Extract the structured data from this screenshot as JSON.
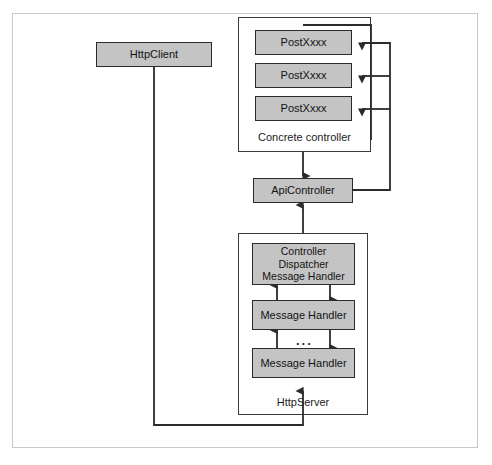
{
  "figure": {
    "background": "#ffffff",
    "frame_color": "#c9c9c9",
    "node_fill": "#c4c4c4",
    "node_stroke": "#2b2b2b",
    "line_color": "#2b2b2b"
  },
  "nodes": {
    "http_client": {
      "label": "HttpClient"
    },
    "api_controller": {
      "label": "ApiController"
    },
    "post_action_1": {
      "label": "PostXxxx"
    },
    "post_action_2": {
      "label": "PostXxxx"
    },
    "post_action_3": {
      "label": "PostXxxx"
    },
    "controller_dispatcher": {
      "line1": "Controller Dispatcher",
      "line2": "Message Handler"
    },
    "message_handler_1": {
      "label": "Message Handler"
    },
    "message_handler_2": {
      "label": "Message Handler"
    },
    "handler_ellipsis": {
      "label": "..."
    }
  },
  "groups": {
    "concrete_controller": {
      "label": "Concrete controller"
    },
    "http_server": {
      "label": "HttpServer"
    }
  }
}
